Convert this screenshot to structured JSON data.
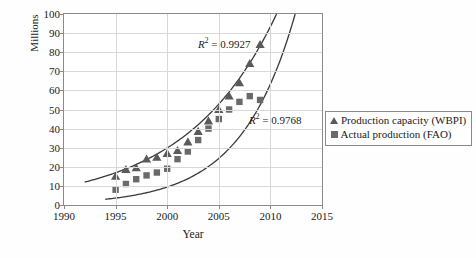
{
  "chart_data": {
    "type": "scatter",
    "title": "",
    "xlabel": "Year",
    "ylabel": "World production (m⁻³)",
    "ylabel_units": "Millions",
    "xlim": [
      1990,
      2015
    ],
    "ylim": [
      0,
      100
    ],
    "xticks": [
      1990,
      1995,
      2000,
      2005,
      2010,
      2015
    ],
    "yticks": [
      0,
      10,
      20,
      30,
      40,
      50,
      60,
      70,
      80,
      90,
      100
    ],
    "grid": "horizontal-and-vertical",
    "legend_position": "right-outside",
    "series": [
      {
        "name": "Production capacity (WBPI)",
        "marker": "triangle",
        "color": "#5a5a5a",
        "trendline": "exponential",
        "r_squared": "0.9927",
        "r_squared_label": "R² = 0.9927",
        "x": [
          1995,
          1996,
          1997,
          1998,
          1999,
          2000,
          2001,
          2002,
          2003,
          2004,
          2005,
          2006,
          2007,
          2008,
          2009
        ],
        "y": [
          15,
          18.5,
          19.5,
          24,
          25,
          27,
          28.5,
          33,
          38.5,
          44,
          50,
          57,
          64,
          74,
          84
        ]
      },
      {
        "name": "Actual production (FAO)",
        "marker": "square",
        "color": "#6a6a6a",
        "trendline": "exponential",
        "r_squared": "0.9768",
        "r_squared_label": "R² = 0.9768",
        "x": [
          1995,
          1996,
          1997,
          1998,
          1999,
          2000,
          2001,
          2002,
          2003,
          2004,
          2005,
          2006,
          2007,
          2008,
          2009
        ],
        "y": [
          8,
          11,
          13.5,
          15.5,
          17,
          19,
          24,
          28,
          34,
          40,
          45,
          50,
          54,
          57,
          55
        ]
      }
    ],
    "trendlines": [
      {
        "name": "Production capacity trend",
        "r_squared_label": "R² = 0.9927",
        "x_start": 1992,
        "x_end": 2010.6,
        "y_start": 12,
        "y_end": 100
      },
      {
        "name": "Actual production trend",
        "r_squared_label": "R² = 0.9768",
        "x_start": 1994,
        "x_end": 2012.4,
        "y_start": 3,
        "y_end": 100
      }
    ]
  },
  "legend": {
    "items": [
      {
        "label": "Production capacity (WBPI)",
        "marker": "triangle"
      },
      {
        "label": "Actual production (FAO)",
        "marker": "square"
      }
    ]
  },
  "annotations": {
    "r2_capacity": "R² = 0.9927",
    "r2_actual": "R² = 0.9768",
    "r2_capacity_prefix": "R",
    "r2_capacity_value": " = 0.9927",
    "r2_actual_prefix": "R",
    "r2_actual_value": " = 0.9768"
  },
  "axes": {
    "x_title": "Year",
    "y_title_main": "World production (m",
    "y_title_exp": "−3",
    "y_title_tail": ")",
    "y_units": "Millions",
    "xtick_labels": [
      "1990",
      "1995",
      "2000",
      "2005",
      "2010",
      "2015"
    ],
    "ytick_labels": [
      "0",
      "10",
      "20",
      "30",
      "40",
      "50",
      "60",
      "70",
      "80",
      "90",
      "100"
    ]
  }
}
